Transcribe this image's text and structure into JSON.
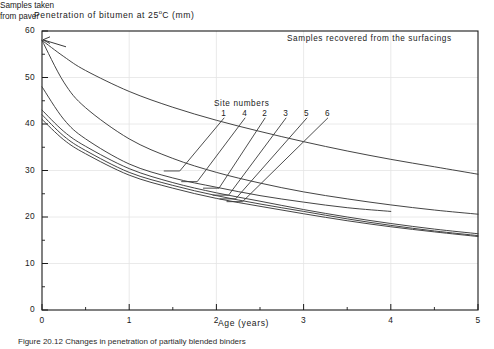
{
  "figure": {
    "caption": "Figure 20.12   Changes in penetration of partially blended binders"
  },
  "axes": {
    "y_title_main": "Penetration of bitumen at 25",
    "y_title_degree": "o",
    "y_title_tail": "C (mm)",
    "x_title": "Age (years)",
    "y_ticks": [
      "0",
      "10",
      "20",
      "30",
      "40",
      "50",
      "60"
    ],
    "x_ticks": [
      "0",
      "1",
      "2",
      "3",
      "4",
      "5"
    ]
  },
  "annotations": {
    "paver": "Samples taken\nfrom paver",
    "paver_line1": "Samples taken",
    "paver_line2": "from paver",
    "surfacings": "Samples recovered from the surfacings",
    "site_numbers_title": "Site numbers",
    "site_numbers": [
      "1",
      "4",
      "2",
      "3",
      "5",
      "6"
    ]
  },
  "colors": {
    "ink": "#161616",
    "curve": "#3a3a3a",
    "grid": "#e4e4e4",
    "axis": "#1a1a1a",
    "background": "#ffffff"
  },
  "chart_data": {
    "type": "line",
    "xlabel": "Age (years)",
    "ylabel": "Penetration of bitumen at 25 oC (mm)",
    "xlim": [
      0,
      5
    ],
    "ylim": [
      0,
      60
    ],
    "x_major_ticks": [
      0,
      1,
      2,
      3,
      4,
      5
    ],
    "y_major_ticks": [
      0,
      10,
      20,
      30,
      40,
      50,
      60
    ],
    "x_minor_tick_step": 0.5,
    "y_minor_tick_step": 5,
    "grid": true,
    "legend": "none",
    "legend_position": "inline-leader-labels",
    "annotations": [
      {
        "text": "Samples taken from paver",
        "points_to": {
          "x": 0,
          "y": 58
        }
      },
      {
        "text": "Samples recovered from the surfacings",
        "x": 3.0,
        "y": 57
      },
      {
        "text": "Site numbers",
        "x": 2.0,
        "y": 44
      }
    ],
    "series": [
      {
        "name": "1",
        "label": "Site 1",
        "x": [
          0,
          0.25,
          0.5,
          1.0,
          1.5,
          2.0,
          2.5,
          3.0,
          3.5,
          4.0,
          4.5,
          5.0
        ],
        "y": [
          58.0,
          54.5,
          51.5,
          47.0,
          43.6,
          40.8,
          38.4,
          36.2,
          34.2,
          32.4,
          30.8,
          29.2
        ]
      },
      {
        "name": "4",
        "label": "Site 4",
        "x": [
          0,
          0.25,
          0.5,
          1.0,
          1.5,
          2.0,
          2.5,
          3.0,
          3.5,
          4.0,
          4.5,
          5.0
        ],
        "y": [
          58.0,
          49.0,
          43.5,
          36.8,
          32.6,
          29.6,
          27.3,
          25.4,
          23.9,
          22.6,
          21.5,
          20.6
        ]
      },
      {
        "name": "2",
        "label": "Site 2",
        "x": [
          0,
          0.25,
          0.5,
          1.0,
          1.5,
          2.0,
          2.5,
          3.0,
          3.5,
          4.0
        ],
        "y": [
          48.0,
          41.0,
          36.8,
          31.4,
          28.4,
          26.4,
          24.6,
          23.2,
          22.0,
          21.2
        ]
      },
      {
        "name": "3",
        "label": "Site 3",
        "x": [
          0,
          0.25,
          0.5,
          1.0,
          1.5,
          2.0,
          2.5,
          3.0,
          3.5,
          4.0,
          4.5,
          5.0
        ],
        "y": [
          43.0,
          38.4,
          35.2,
          30.4,
          27.4,
          25.2,
          23.4,
          21.6,
          20.0,
          18.6,
          17.4,
          16.4
        ]
      },
      {
        "name": "5",
        "label": "Site 5",
        "x": [
          0,
          0.25,
          0.5,
          1.0,
          1.5,
          2.0,
          2.5,
          3.0,
          3.5,
          4.0,
          4.5,
          5.0
        ],
        "y": [
          42.0,
          37.4,
          34.3,
          29.6,
          26.8,
          24.6,
          22.8,
          21.2,
          19.6,
          18.2,
          17.0,
          16.0
        ]
      },
      {
        "name": "6",
        "label": "Site 6",
        "x": [
          0,
          0.25,
          0.5,
          1.0,
          1.5,
          2.0,
          2.5,
          3.0,
          3.5,
          4.0,
          4.5,
          5.0
        ],
        "y": [
          41.0,
          36.6,
          33.6,
          29.0,
          26.2,
          24.0,
          22.3,
          20.7,
          19.2,
          17.9,
          16.8,
          15.8
        ]
      }
    ],
    "leader_labels": [
      {
        "name": "1",
        "label_x": 2.09,
        "label_y": 42.2,
        "anchor_x": 1.58,
        "anchor_y": 29.9
      },
      {
        "name": "4",
        "label_x": 2.33,
        "label_y": 42.2,
        "anchor_x": 1.78,
        "anchor_y": 27.6
      },
      {
        "name": "2",
        "label_x": 2.56,
        "label_y": 42.2,
        "anchor_x": 2.03,
        "anchor_y": 26.2
      },
      {
        "name": "3",
        "label_x": 2.8,
        "label_y": 42.2,
        "anchor_x": 2.14,
        "anchor_y": 24.7
      },
      {
        "name": "5",
        "label_x": 3.04,
        "label_y": 42.2,
        "anchor_x": 2.22,
        "anchor_y": 23.9
      },
      {
        "name": "6",
        "label_x": 3.28,
        "label_y": 42.2,
        "anchor_x": 2.3,
        "anchor_y": 23.3
      }
    ]
  }
}
